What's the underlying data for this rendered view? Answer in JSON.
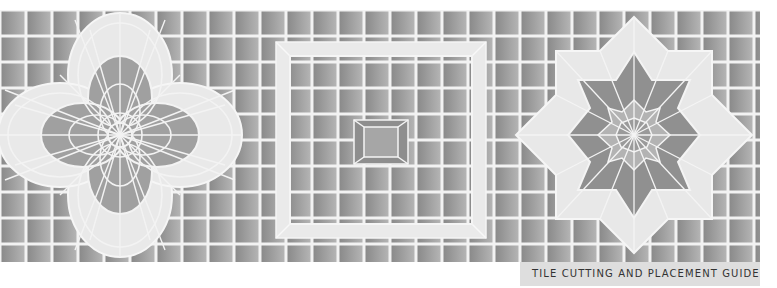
{
  "caption": {
    "label": "TILE CUTTING AND PLACEMENT GUIDE"
  },
  "colors": {
    "background": "#ffffff",
    "grout": "#f2f2f2",
    "tile_dark": "#8e8e8e",
    "tile_mid": "#a8a8a8",
    "tile_light": "#e6e6e6",
    "caption_bg": "#dedede",
    "caption_text": "#333333"
  },
  "grid": {
    "x0": 0,
    "y0": 10,
    "x1": 760,
    "y1": 262,
    "pitch": 26
  },
  "patterns": [
    {
      "name": "four-petal-flower",
      "cx": 120,
      "cy": 135
    },
    {
      "name": "nested-square",
      "cx": 381,
      "cy": 135
    },
    {
      "name": "eight-point-star",
      "cx": 634,
      "cy": 135
    }
  ]
}
